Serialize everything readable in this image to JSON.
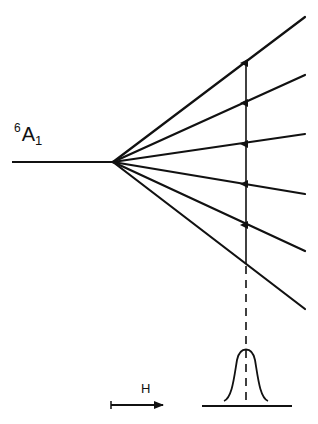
{
  "diagram": {
    "state_label": {
      "multiplicity": "6",
      "term": "A",
      "subscript": "1"
    },
    "field_label": "H",
    "colors": {
      "line": "#111111",
      "background": "#ffffff"
    },
    "unsplit_level": {
      "x1": 12,
      "y1": 162,
      "x2": 113,
      "y2": 162
    },
    "split_point": {
      "x": 113,
      "y": 162
    },
    "split_levels_right_end_y": [
      17,
      75,
      134,
      194,
      251,
      309
    ],
    "split_levels_right_end_x": 305,
    "transition_line_x": 246,
    "transition_arrow_tips_y": [
      61,
      101,
      142,
      182,
      223
    ],
    "transition_start_y": 264,
    "dashed_line": {
      "y1": 264,
      "y2": 403
    },
    "absorption_peak": {
      "center_x": 246,
      "baseline_y": 403,
      "peak_y": 349,
      "half_width": 22
    },
    "baseline": {
      "x1": 202,
      "x2": 292,
      "y": 406
    },
    "field_arrow": {
      "x1": 111,
      "x2": 163,
      "y": 405
    }
  }
}
